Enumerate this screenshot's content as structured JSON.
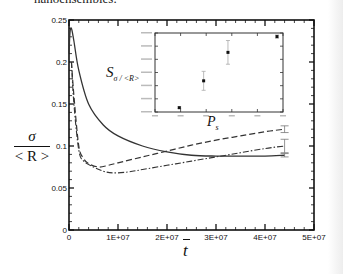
{
  "page": {
    "caption_fragment": "nanoensembles."
  },
  "chart_data": [
    {
      "type": "line",
      "title": "",
      "xlabel": "t̄",
      "ylabel_num": "σ",
      "ylabel_den": "< R >",
      "xlim": [
        0,
        50000000.0
      ],
      "ylim": [
        0,
        0.25
      ],
      "grid": false,
      "legend": "none",
      "x_ticks": [
        "0",
        "1E+07",
        "2E+07",
        "3E+07",
        "4E+07",
        "5E+07"
      ],
      "y_ticks": [
        "0",
        "0.05",
        "0.1",
        "0.15",
        "0.2",
        "0.25"
      ],
      "series": [
        {
          "name": "solid",
          "style": "solid",
          "x": [
            0,
            200000.0,
            500000.0,
            1000000.0,
            2000000.0,
            4000000.0,
            7000000.0,
            10000000.0,
            15000000.0,
            20000000.0,
            25000000.0,
            30000000.0,
            35000000.0,
            40000000.0,
            44000000.0
          ],
          "y": [
            0.21,
            0.235,
            0.24,
            0.225,
            0.19,
            0.15,
            0.125,
            0.112,
            0.1,
            0.093,
            0.089,
            0.088,
            0.088,
            0.088,
            0.089
          ]
        },
        {
          "name": "dashed",
          "style": "dashed",
          "x": [
            500000.0,
            1000000.0,
            2000000.0,
            3000000.0,
            4000000.0,
            6000000.0,
            8000000.0,
            10000000.0,
            15000000.0,
            20000000.0,
            25000000.0,
            30000000.0,
            35000000.0,
            40000000.0,
            44000000.0
          ],
          "y": [
            0.2,
            0.16,
            0.1,
            0.085,
            0.079,
            0.075,
            0.077,
            0.08,
            0.087,
            0.094,
            0.101,
            0.107,
            0.112,
            0.117,
            0.12
          ]
        },
        {
          "name": "dash-dot",
          "style": "dashdot",
          "x": [
            500000.0,
            1000000.0,
            2000000.0,
            3000000.0,
            5000000.0,
            7000000.0,
            9000000.0,
            12000000.0,
            15000000.0,
            20000000.0,
            25000000.0,
            30000000.0,
            35000000.0,
            40000000.0,
            44000000.0
          ],
          "y": [
            0.2,
            0.15,
            0.095,
            0.082,
            0.075,
            0.07,
            0.068,
            0.069,
            0.072,
            0.077,
            0.082,
            0.087,
            0.092,
            0.097,
            0.1
          ]
        }
      ],
      "error_bars_at_end": [
        {
          "series": "solid",
          "x": 44000000.0,
          "y": 0.089,
          "err": 0.002
        },
        {
          "series": "dashed",
          "x": 44000000.0,
          "y": 0.12,
          "err": 0.004
        },
        {
          "series": "dash-dot",
          "x": 44000000.0,
          "y": 0.1,
          "err": 0.008
        }
      ]
    },
    {
      "type": "scatter",
      "role": "inset",
      "title": "",
      "xlabel": "P_s",
      "ylabel": "S_σ/<R>",
      "tick_labels_legible": false,
      "points": [
        {
          "x_index": 1,
          "y_frac": 0.08,
          "err_frac": 0.01
        },
        {
          "x_index": 2,
          "y_frac": 0.42,
          "err_frac": 0.12
        },
        {
          "x_index": 3,
          "y_frac": 0.78,
          "err_frac": 0.15
        },
        {
          "x_index": 4,
          "y_frac": 0.98,
          "err_frac": 0.02
        }
      ]
    }
  ]
}
